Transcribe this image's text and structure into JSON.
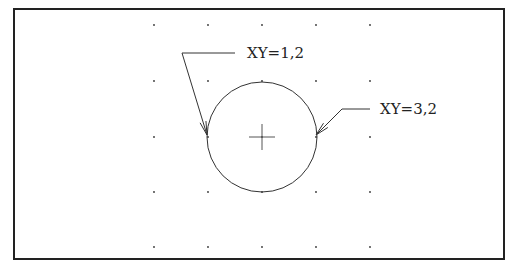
{
  "diagram": {
    "frame": {
      "x": 14,
      "y": 9,
      "width": 490,
      "height": 250,
      "stroke": "#222222"
    },
    "grid": {
      "xs": [
        154,
        208,
        262,
        316,
        370
      ],
      "ys": [
        25,
        81,
        137,
        192,
        247
      ],
      "dot_color": "#333333"
    },
    "circle": {
      "cx": 262,
      "cy": 137,
      "r": 55,
      "stroke": "#333333"
    },
    "center_mark": {
      "x": 262,
      "y": 137,
      "size": 13
    },
    "callouts": [
      {
        "label": "XY=1,2",
        "text_x": 247,
        "text_y": 58,
        "leader": [
          [
            235,
            53
          ],
          [
            182,
            53
          ],
          [
            207,
            135
          ]
        ]
      },
      {
        "label": "XY=3,2",
        "text_x": 380,
        "text_y": 114,
        "leader": [
          [
            370,
            109
          ],
          [
            342,
            109
          ],
          [
            316,
            135
          ]
        ]
      }
    ]
  }
}
